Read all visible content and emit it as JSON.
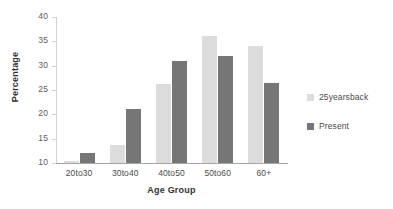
{
  "chart_data": {
    "type": "bar",
    "title": "",
    "xlabel": "Age Group",
    "ylabel": "Percentage",
    "categories": [
      "20to30",
      "30to40",
      "40to50",
      "50to60",
      "60+"
    ],
    "series": [
      {
        "name": "25yearsback",
        "color": "#dcdcdc",
        "values": [
          10.5,
          13.7,
          26.3,
          36.2,
          34.0
        ]
      },
      {
        "name": "Present",
        "color": "#767676",
        "values": [
          12.0,
          21.0,
          31.0,
          32.0,
          26.4
        ]
      }
    ],
    "ylim": [
      10,
      40
    ],
    "ytick_step": 5,
    "yticks": [
      40,
      35,
      30,
      25,
      20,
      15,
      10
    ],
    "grid": false,
    "legend_position": "right",
    "background": "#ffffff"
  }
}
